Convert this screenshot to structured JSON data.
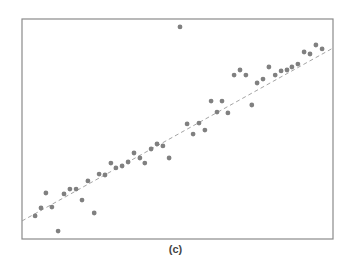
{
  "figure": {
    "caption": "(c)"
  },
  "style": {
    "frame_color": "#8a8a8a",
    "point_color": "#808080",
    "line_color": "#9a9a9a",
    "background": "#ffffff"
  },
  "chart_data": {
    "type": "scatter",
    "title": "",
    "xlabel": "",
    "ylabel": "",
    "caption": "(c)",
    "xlim": [
      0,
      100
    ],
    "ylim": [
      0,
      100
    ],
    "grid": false,
    "legend": null,
    "axis_ticks": "none",
    "note": "Coordinates normalized to the plot frame (0 = left/bottom, 100 = right/top); no axis tick labels are shown.",
    "series": [
      {
        "name": "points",
        "marker": "circle",
        "points": [
          [
            4.2,
            10.5
          ],
          [
            6.1,
            14.1
          ],
          [
            7.7,
            20.9
          ],
          [
            9.6,
            14.5
          ],
          [
            11.6,
            3.6
          ],
          [
            13.5,
            20.5
          ],
          [
            15.4,
            22.7
          ],
          [
            17.4,
            22.7
          ],
          [
            19.3,
            17.7
          ],
          [
            21.2,
            26.4
          ],
          [
            23.2,
            11.8
          ],
          [
            24.8,
            29.5
          ],
          [
            26.7,
            29.1
          ],
          [
            28.6,
            34.5
          ],
          [
            30.2,
            32.3
          ],
          [
            32.2,
            33.2
          ],
          [
            34.1,
            35.0
          ],
          [
            36.0,
            39.1
          ],
          [
            37.9,
            36.8
          ],
          [
            39.5,
            34.5
          ],
          [
            41.5,
            40.9
          ],
          [
            43.4,
            43.2
          ],
          [
            45.3,
            42.3
          ],
          [
            47.3,
            36.8
          ],
          [
            50.8,
            96.4
          ],
          [
            53.1,
            52.3
          ],
          [
            55.0,
            47.7
          ],
          [
            56.9,
            52.7
          ],
          [
            58.8,
            49.5
          ],
          [
            60.8,
            62.7
          ],
          [
            62.7,
            57.7
          ],
          [
            64.3,
            62.7
          ],
          [
            66.2,
            57.3
          ],
          [
            68.2,
            74.5
          ],
          [
            70.1,
            76.8
          ],
          [
            72.0,
            74.5
          ],
          [
            73.9,
            60.9
          ],
          [
            75.6,
            70.9
          ],
          [
            77.5,
            72.7
          ],
          [
            79.4,
            78.2
          ],
          [
            81.4,
            74.5
          ],
          [
            83.3,
            76.4
          ],
          [
            85.2,
            76.8
          ],
          [
            86.8,
            78.2
          ],
          [
            88.7,
            79.5
          ],
          [
            90.7,
            85.0
          ],
          [
            92.6,
            84.1
          ],
          [
            94.5,
            88.2
          ],
          [
            96.5,
            86.4
          ]
        ]
      },
      {
        "name": "trend",
        "style": "dashed",
        "type": "line",
        "x": [
          0,
          100
        ],
        "y": [
          8.2,
          86.8
        ]
      }
    ]
  }
}
